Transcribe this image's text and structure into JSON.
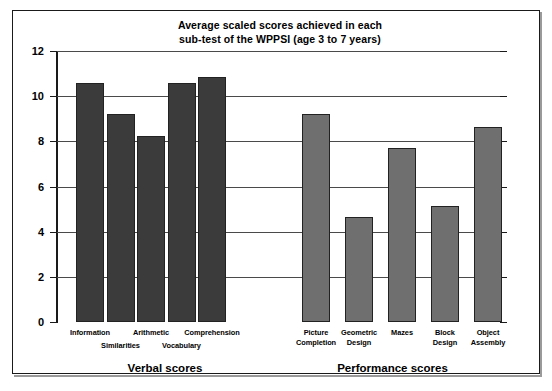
{
  "chart_data": {
    "type": "bar",
    "title": "Average scaled scores achieved in each sub-test of the WPPSI (age 3 to 7 years)",
    "title_line1": "Average scaled scores achieved in each",
    "title_line2": "sub-test of the WPPSI (age 3 to 7 years)",
    "xlabel": "",
    "ylabel": "",
    "ylim": [
      0,
      12
    ],
    "ytick_values": [
      0,
      2,
      4,
      6,
      8,
      10,
      12
    ],
    "ytick_labels": [
      "0",
      "2",
      "4",
      "6",
      "8",
      "10",
      "12"
    ],
    "grid": true,
    "legend": "none",
    "groups": [
      {
        "name": "Verbal scores",
        "color": "#3b3b3b",
        "categories": [
          "Information",
          "Similarities",
          "Arithmetic",
          "Vocabulary",
          "Comprehension"
        ],
        "values": [
          10.6,
          9.2,
          8.25,
          10.6,
          10.85
        ]
      },
      {
        "name": "Performance scores",
        "color": "#6f6f6f",
        "categories": [
          "Picture Completion",
          "Geometric Design",
          "Mazes",
          "Block Design",
          "Object Assembly"
        ],
        "values": [
          9.2,
          4.65,
          7.7,
          5.15,
          8.65
        ]
      }
    ],
    "categories": [
      "Information",
      "Similarities",
      "Arithmetic",
      "Vocabulary",
      "Comprehension",
      "Picture Completion",
      "Geometric Design",
      "Mazes",
      "Block Design",
      "Object Assembly"
    ],
    "values": [
      10.6,
      9.2,
      8.25,
      10.6,
      10.85,
      9.2,
      4.65,
      7.7,
      5.15,
      8.65
    ]
  },
  "axis": {
    "y_ticks": [
      "12",
      "10",
      "8",
      "6",
      "4",
      "2",
      "0"
    ]
  },
  "bars": [
    {
      "label_line1": "Information",
      "label_line2": "",
      "value": 10.6,
      "series": "verbal",
      "label_row": 0
    },
    {
      "label_line1": "Similarities",
      "label_line2": "",
      "value": 9.2,
      "series": "verbal",
      "label_row": 1
    },
    {
      "label_line1": "Arithmetic",
      "label_line2": "",
      "value": 8.25,
      "series": "verbal",
      "label_row": 0
    },
    {
      "label_line1": "Vocabulary",
      "label_line2": "",
      "value": 10.6,
      "series": "verbal",
      "label_row": 1
    },
    {
      "label_line1": "Comprehension",
      "label_line2": "",
      "value": 10.85,
      "series": "verbal",
      "label_row": 0
    },
    {
      "label_line1": "Picture",
      "label_line2": "Completion",
      "value": 9.2,
      "series": "performance",
      "label_row": 0
    },
    {
      "label_line1": "Geometric",
      "label_line2": "Design",
      "value": 4.65,
      "series": "performance",
      "label_row": 0
    },
    {
      "label_line1": "Mazes",
      "label_line2": "",
      "value": 7.7,
      "series": "performance",
      "label_row": 1
    },
    {
      "label_line1": "Block",
      "label_line2": "Design",
      "value": 5.15,
      "series": "performance",
      "label_row": 0
    },
    {
      "label_line1": "Object",
      "label_line2": "Assembly",
      "value": 8.65,
      "series": "performance",
      "label_row": 0
    }
  ],
  "group_labels": {
    "verbal": "Verbal scores",
    "performance": "Performance scores"
  },
  "colors": {
    "verbal_bar": "#3b3b3b",
    "performance_bar": "#6f6f6f",
    "gridline": "#4a4a4a",
    "axis": "#1a1a1a",
    "background": "#ffffff"
  }
}
